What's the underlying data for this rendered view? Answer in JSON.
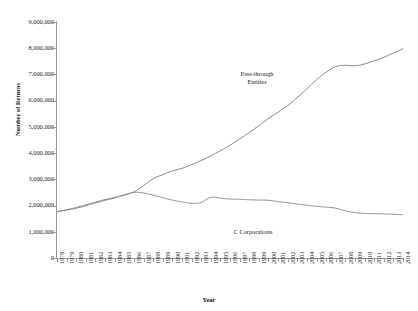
{
  "chart_data": {
    "type": "line",
    "title": "",
    "xlabel": "Year",
    "ylabel": "Number of Returns",
    "grid": false,
    "legend_position": "inline-annotation",
    "ylim": [
      0,
      9000000
    ],
    "ytick_labels": [
      "9,000,000",
      "8,000,000",
      "7,000,000",
      "6,000,000",
      "5,000,000",
      "4,000,000",
      "3,000,000",
      "2,000,000",
      "1,000,000",
      "0"
    ],
    "ytick_values": [
      9000000,
      8000000,
      7000000,
      6000000,
      5000000,
      4000000,
      3000000,
      2000000,
      1000000,
      0
    ],
    "x": [
      1978,
      1979,
      1980,
      1981,
      1982,
      1983,
      1984,
      1985,
      1986,
      1987,
      1988,
      1989,
      1990,
      1991,
      1992,
      1993,
      1994,
      1995,
      1996,
      1997,
      1998,
      1999,
      2000,
      2001,
      2002,
      2003,
      2004,
      2005,
      2006,
      2007,
      2008,
      2009,
      2010,
      2011,
      2012,
      2013,
      2014
    ],
    "categories": [
      "1978",
      "1979",
      "1980",
      "1981",
      "1982",
      "1983",
      "1984",
      "1985",
      "1986",
      "1987",
      "1988",
      "1989",
      "1990",
      "1991",
      "1992",
      "1993",
      "1994",
      "1995",
      "1996",
      "1997",
      "1998",
      "1999",
      "2000",
      "2001",
      "2002",
      "2003",
      "2004",
      "2005",
      "2006",
      "2007",
      "2008",
      "2009",
      "2010",
      "2011",
      "2012",
      "2013",
      "2014"
    ],
    "series": [
      {
        "name": "Pass-through Entities",
        "color": "#7c7c7c",
        "values": [
          1770000,
          1830000,
          1900000,
          1990000,
          2100000,
          2200000,
          2290000,
          2400000,
          2520000,
          2760000,
          3020000,
          3180000,
          3320000,
          3420000,
          3560000,
          3720000,
          3900000,
          4090000,
          4300000,
          4540000,
          4780000,
          5050000,
          5320000,
          5560000,
          5810000,
          6120000,
          6450000,
          6800000,
          7090000,
          7300000,
          7350000,
          7330000,
          7400000,
          7520000,
          7650000,
          7820000,
          7980000
        ]
      },
      {
        "name": "C Corporations",
        "color": "#8a8a8a",
        "values": [
          1760000,
          1840000,
          1930000,
          2030000,
          2130000,
          2230000,
          2310000,
          2410000,
          2500000,
          2480000,
          2400000,
          2300000,
          2210000,
          2140000,
          2090000,
          2120000,
          2310000,
          2280000,
          2250000,
          2240000,
          2220000,
          2210000,
          2200000,
          2150000,
          2110000,
          2060000,
          2010000,
          1970000,
          1940000,
          1900000,
          1800000,
          1730000,
          1700000,
          1690000,
          1680000,
          1670000,
          1650000
        ]
      }
    ],
    "annotations": [
      {
        "text_line1": "Pass-through",
        "text_line2": "Entities"
      },
      {
        "text": "C Corporations"
      }
    ]
  },
  "axis": {
    "y_title": "Number of Returns",
    "x_title": "Year"
  },
  "labels": {
    "pass_through_line1": "Pass-through",
    "pass_through_line2": "Entities",
    "c_corporations": "C Corporations"
  }
}
